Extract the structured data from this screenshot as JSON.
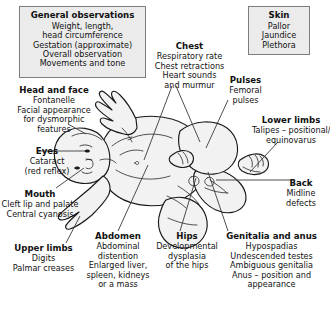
{
  "figure": {
    "colors": {
      "panel_fill": "#ebebeb",
      "panel_border": "#7d7d7d",
      "text": "#111111",
      "leader_line": "#3a3a3a",
      "body_outline": "#1a1a1a",
      "body_fill": "#f2f2f2"
    }
  },
  "panels": [
    {
      "id": "general-observations",
      "title": "General observations",
      "lines": [
        "Weight, length,",
        "head circumference",
        "Gestation (approximate)",
        "Overall observation",
        "Movements and tone"
      ]
    },
    {
      "id": "skin",
      "title": "Skin",
      "lines": [
        "Pallor",
        "Jaundice",
        "Plethora"
      ]
    }
  ],
  "callouts": [
    {
      "id": "head-and-face",
      "title": "Head and face",
      "lines": [
        "Fontanelle",
        "Facial appearance",
        "for dysmorphic",
        "features"
      ]
    },
    {
      "id": "eyes",
      "title": "Eyes",
      "lines": [
        "Cataract",
        "(red reflex)"
      ]
    },
    {
      "id": "mouth",
      "title": "Mouth",
      "lines": [
        "Cleft lip and palate",
        "Central cyanosis"
      ]
    },
    {
      "id": "upper-limbs",
      "title": "Upper limbs",
      "lines": [
        "Digits",
        "Palmar creases"
      ]
    },
    {
      "id": "chest",
      "title": "Chest",
      "lines": [
        "Respiratory rate",
        "Chest retractions",
        "Heart sounds",
        "and murmur"
      ]
    },
    {
      "id": "abdomen",
      "title": "Abdomen",
      "lines": [
        "Abdominal",
        "distention",
        "Enlarged liver,",
        "spleen, kidneys",
        "or a mass"
      ]
    },
    {
      "id": "hips",
      "title": "Hips",
      "lines": [
        "Developmental",
        "dysplasia",
        "of the hips"
      ]
    },
    {
      "id": "pulses",
      "title": "Pulses",
      "lines": [
        "Femoral",
        "pulses"
      ]
    },
    {
      "id": "lower-limbs",
      "title": "Lower limbs",
      "lines": [
        "Talipes – positional/",
        "equinovarus"
      ]
    },
    {
      "id": "back",
      "title": "Back",
      "lines": [
        "Midline",
        "defects"
      ]
    },
    {
      "id": "genitalia-and-anus",
      "title": "Genitalia and anus",
      "lines": [
        "Hypospadias",
        "Undescended testes",
        "Ambiguous genitalia",
        "Anus – position and",
        "appearance"
      ]
    }
  ]
}
